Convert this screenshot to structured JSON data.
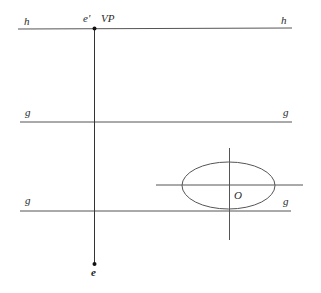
{
  "diagram": {
    "type": "perspective-construction",
    "lines": {
      "horizon": {
        "left_label": "h",
        "right_label": "h"
      },
      "ground_upper": {
        "left_label": "g",
        "right_label": "g"
      },
      "ground_lower": {
        "left_label": "g",
        "right_label": "g"
      }
    },
    "points": {
      "vanishing_point": {
        "label_eye_projection": "e'",
        "label": "VP"
      },
      "eye": {
        "label": "e"
      },
      "ellipse_center": {
        "label": "O"
      }
    },
    "colors": {
      "line": "#555555",
      "point": "#111111",
      "text": "#2a2a2a",
      "background": "#ffffff"
    }
  }
}
